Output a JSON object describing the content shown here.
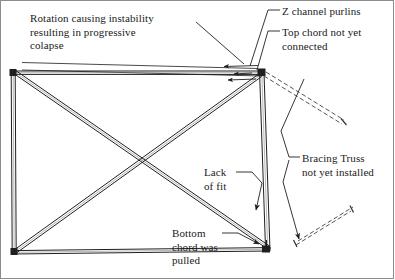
{
  "figure": {
    "type": "engineering-diagram",
    "background_color": "#ffffff",
    "line_color": "#222222",
    "dashed_color": "#555555"
  },
  "annotations": {
    "rotation": "Rotation causing instability\nresulting in progressive\ncolapse",
    "purlins": "Z channel purlins",
    "top_chord": "Top chord not yet\nconnected",
    "bracing": "Bracing Truss\nnot yet installed",
    "lack_of_fit": "Lack\nof fit",
    "bottom_chord": "Bottom\nchord was\npulled"
  },
  "geometry": {
    "left_column": {
      "top": [
        13,
        72
      ],
      "bottom": [
        14,
        253
      ]
    },
    "right_column": {
      "top": [
        262,
        72
      ],
      "bottom": [
        268,
        250
      ]
    },
    "top_chord": {
      "left": [
        13,
        72
      ],
      "right": [
        262,
        72
      ]
    },
    "bottom_chord": {
      "left": [
        14,
        253
      ],
      "right": [
        268,
        250
      ]
    },
    "diagonal_1": {
      "from": [
        13,
        74
      ],
      "to": [
        266,
        249
      ]
    },
    "diagonal_2": {
      "from": [
        14,
        251
      ],
      "to": [
        260,
        74
      ]
    },
    "purlin_upper": {
      "from": [
        22,
        63
      ],
      "to": [
        258,
        69
      ]
    },
    "purlin_lower": {
      "from": [
        22,
        70
      ],
      "to": [
        260,
        76
      ]
    },
    "brace_upper_dashed": {
      "from": [
        266,
        74
      ],
      "to": [
        345,
        122
      ]
    },
    "brace_lower_dashed": {
      "from": [
        296,
        243
      ],
      "to": [
        352,
        209
      ]
    }
  },
  "leaders": {
    "rotation": [
      [
        196,
        22
      ],
      [
        240,
        62
      ]
    ],
    "purlins": [
      [
        278,
        10
      ],
      [
        268,
        10
      ],
      [
        250,
        66
      ]
    ],
    "top_chord": [
      [
        278,
        31
      ],
      [
        268,
        31
      ],
      [
        258,
        72
      ]
    ],
    "bracing_upper": [
      [
        298,
        157
      ],
      [
        288,
        157
      ],
      [
        280,
        130
      ],
      [
        305,
        78
      ]
    ],
    "bracing_lower": [
      [
        288,
        160
      ],
      [
        282,
        180
      ],
      [
        300,
        240
      ]
    ],
    "lack_of_fit": [
      [
        236,
        172
      ],
      [
        252,
        172
      ],
      [
        262,
        182
      ],
      [
        256,
        212
      ]
    ],
    "bottom_chord": [
      [
        222,
        233
      ],
      [
        238,
        233
      ],
      [
        262,
        245
      ]
    ]
  }
}
